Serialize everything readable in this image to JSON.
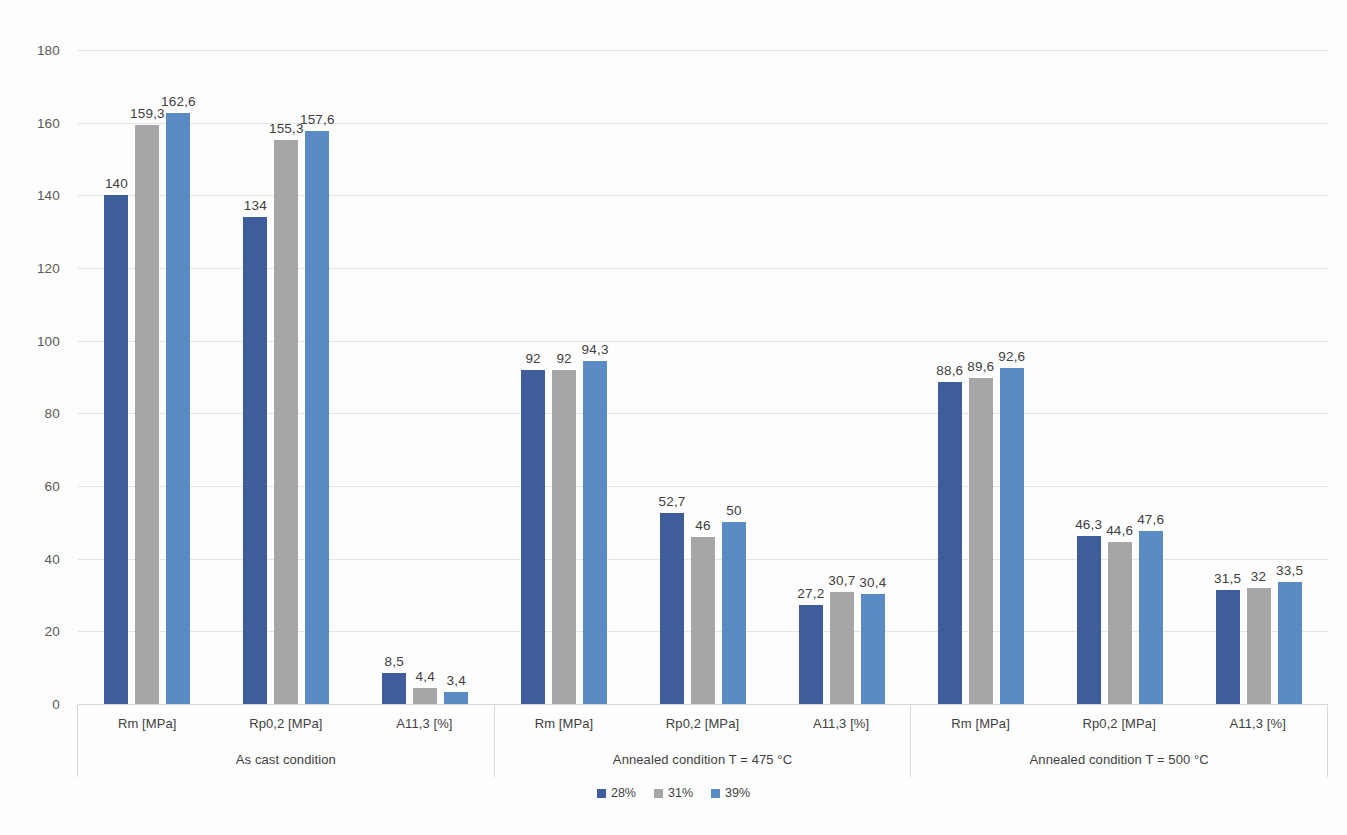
{
  "chart_data": {
    "type": "bar",
    "title": "",
    "subtitle": "",
    "xlabel": "",
    "ylabel": "",
    "ylim": [
      0,
      180
    ],
    "ytick_step": 20,
    "yticks": [
      0,
      20,
      40,
      60,
      80,
      100,
      120,
      140,
      160,
      180
    ],
    "grid": true,
    "legend_position": "bottom",
    "orientation": "vertical",
    "group_labels": [
      "As cast condition",
      "Annealed condition T = 475 °C",
      "Annealed condition T = 500 °C"
    ],
    "categories": [
      "Rm [MPa]",
      "Rp0,2 [MPa]",
      "A11,3 [%]"
    ],
    "series": [
      {
        "name": "28%",
        "color": "#3f5d9a",
        "groups": [
          {
            "group": "As cast condition",
            "values": [
              140,
              134,
              8.5
            ],
            "labels": [
              "140",
              "134",
              "8,5"
            ]
          },
          {
            "group": "Annealed condition T = 475 °C",
            "values": [
              92,
              52.7,
              27.2
            ],
            "labels": [
              "92",
              "52,7",
              "27,2"
            ]
          },
          {
            "group": "Annealed condition T = 500 °C",
            "values": [
              88.6,
              46.3,
              31.5
            ],
            "labels": [
              "88,6",
              "46,3",
              "31,5"
            ]
          }
        ]
      },
      {
        "name": "31%",
        "color": "#a6a6a6",
        "groups": [
          {
            "group": "As cast condition",
            "values": [
              159.3,
              155.3,
              4.4
            ],
            "labels": [
              "159,3",
              "155,3",
              "4,4"
            ]
          },
          {
            "group": "Annealed condition T = 475 °C",
            "values": [
              92,
              46,
              30.7
            ],
            "labels": [
              "92",
              "46",
              "30,7"
            ]
          },
          {
            "group": "Annealed condition T = 500 °C",
            "values": [
              89.6,
              44.6,
              32
            ],
            "labels": [
              "89,6",
              "44,6",
              "32"
            ]
          }
        ]
      },
      {
        "name": "39%",
        "color": "#5b8bc4",
        "groups": [
          {
            "group": "As cast condition",
            "values": [
              162.6,
              157.6,
              3.4
            ],
            "labels": [
              "162,6",
              "157,6",
              "3,4"
            ]
          },
          {
            "group": "Annealed condition T = 475 °C",
            "values": [
              94.3,
              50,
              30.4
            ],
            "labels": [
              "94,3",
              "50",
              "30,4"
            ]
          },
          {
            "group": "Annealed condition T = 500 °C",
            "values": [
              92.6,
              47.6,
              33.5
            ],
            "labels": [
              "92,6",
              "47,6",
              "33,5"
            ]
          }
        ]
      }
    ],
    "legend": [
      {
        "label": "28%",
        "color": "#3f5d9a"
      },
      {
        "label": "31%",
        "color": "#a6a6a6"
      },
      {
        "label": "39%",
        "color": "#5b8bc4"
      }
    ]
  }
}
